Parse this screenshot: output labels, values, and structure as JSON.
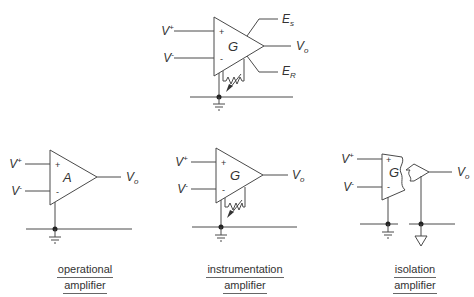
{
  "top_diagram": {
    "name": "instrumentation amplifier with sense and reference",
    "gain_label": "G",
    "inputs": [
      "V+",
      "V-"
    ],
    "outputs": [
      "Es",
      "Vo",
      "ER"
    ],
    "labels": {
      "vplus_main": "V",
      "vplus_sup": "+",
      "vminus_main": "V",
      "vminus_sup": "-",
      "plus_sign": "+",
      "minus_sign": "-",
      "es_main": "E",
      "es_sub": "s",
      "vo_main": "V",
      "vo_sub": "o",
      "er_main": "E",
      "er_sub": "R"
    }
  },
  "amplifiers": [
    {
      "id": "operational",
      "gain_label": "A",
      "caption_line1": "operational",
      "caption_line2": "amplifier"
    },
    {
      "id": "instrumentation",
      "gain_label": "G",
      "caption_line1": "instrumentation",
      "caption_line2": "amplifier"
    },
    {
      "id": "isolation",
      "gain_label": "G",
      "caption_line1": "isolation",
      "caption_line2": "amplifier"
    }
  ],
  "common_labels": {
    "v": "V",
    "plus": "+",
    "minus": "-",
    "o": "o"
  }
}
